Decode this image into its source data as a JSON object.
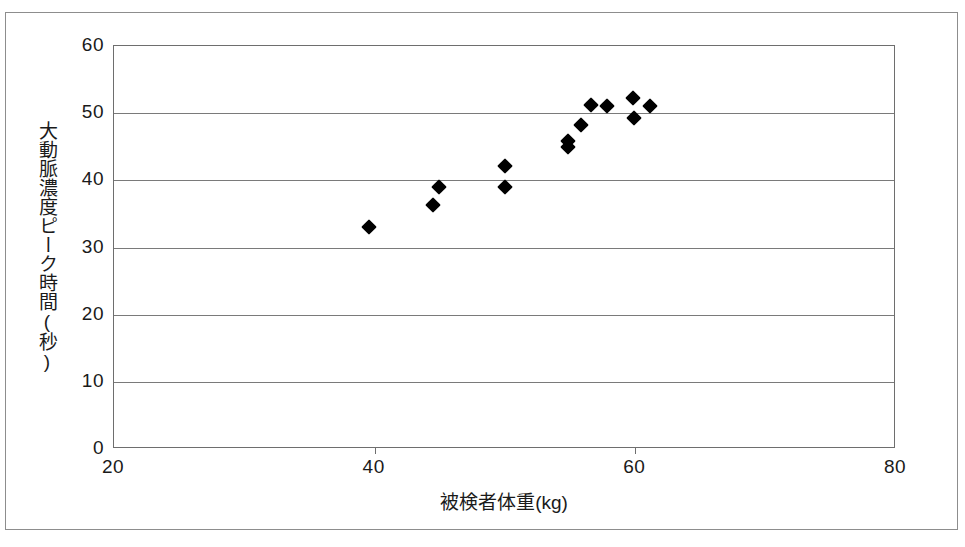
{
  "chart_data": {
    "type": "scatter",
    "title": "",
    "xlabel": "被検者体重(kg)",
    "ylabel": "大動脈濃度ピーク時間(秒)",
    "xlim": [
      20,
      80
    ],
    "ylim": [
      0,
      60
    ],
    "xticks": [
      20,
      40,
      60,
      80
    ],
    "xtick_labels": [
      "20",
      "40",
      "60",
      "80"
    ],
    "yticks": [
      0,
      10,
      20,
      30,
      40,
      50,
      60
    ],
    "ytick_labels": [
      "0",
      "10",
      "20",
      "30",
      "40",
      "50",
      "60"
    ],
    "grid": "horizontal",
    "legend": null,
    "marker": "diamond",
    "marker_color": "#000000",
    "series": [
      {
        "name": "被検者",
        "points": [
          {
            "x": 39.6,
            "y": 33.0
          },
          {
            "x": 44.5,
            "y": 36.3
          },
          {
            "x": 44.9,
            "y": 39.0
          },
          {
            "x": 50.0,
            "y": 39.0
          },
          {
            "x": 50.0,
            "y": 42.1
          },
          {
            "x": 54.8,
            "y": 45.0
          },
          {
            "x": 54.8,
            "y": 45.8
          },
          {
            "x": 55.8,
            "y": 48.2
          },
          {
            "x": 56.6,
            "y": 51.2
          },
          {
            "x": 57.8,
            "y": 51.1
          },
          {
            "x": 59.8,
            "y": 52.3
          },
          {
            "x": 59.9,
            "y": 49.3
          },
          {
            "x": 61.1,
            "y": 51.0
          }
        ]
      }
    ]
  },
  "style": {
    "frame_color": "#8d8d8d",
    "axis_color": "#6e6e6e",
    "grid_color": "#7a7a7a",
    "text_color": "#1a1a1a",
    "background": "#ffffff"
  }
}
